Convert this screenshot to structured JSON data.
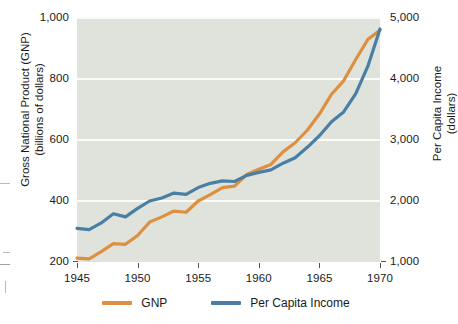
{
  "chart_data": {
    "type": "line",
    "title": "",
    "xlabel": "",
    "ylabel": "Gross National Product (GNP)\n(billions of dollars)",
    "y2label": "Per Capita Income\n(dollars)",
    "grid": true,
    "legend_position": "bottom",
    "xlim": [
      1945,
      1970
    ],
    "ylim": [
      200,
      1000
    ],
    "y2lim": [
      1000,
      5000
    ],
    "xticks": [
      "1945",
      "1950",
      "1955",
      "1960",
      "1965",
      "1970"
    ],
    "xtick_values": [
      1945,
      1950,
      1955,
      1960,
      1965,
      1970
    ],
    "yticks": [
      "200",
      "400",
      "600",
      "800",
      "1,000"
    ],
    "ytick_values": [
      200,
      400,
      600,
      800,
      1000
    ],
    "y2ticks": [
      "1,000",
      "2,000",
      "3,000",
      "4,000",
      "5,000"
    ],
    "y2tick_values": [
      1000,
      2000,
      3000,
      4000,
      5000
    ],
    "x": [
      1945,
      1946,
      1947,
      1948,
      1949,
      1950,
      1951,
      1952,
      1953,
      1954,
      1955,
      1956,
      1957,
      1958,
      1959,
      1960,
      1961,
      1962,
      1963,
      1964,
      1965,
      1966,
      1967,
      1968,
      1969,
      1970
    ],
    "series": [
      {
        "name": "GNP",
        "color": "#dd9040",
        "axis": "left",
        "units": "billions of dollars",
        "values": [
          213,
          210,
          234,
          260,
          258,
          287,
          331,
          348,
          367,
          363,
          400,
          421,
          444,
          449,
          487,
          504,
          520,
          561,
          591,
          632,
          685,
          750,
          794,
          864,
          930,
          960
        ]
      },
      {
        "name": "Per Capita Income",
        "color": "#4a7fa5",
        "axis": "right",
        "units": "dollars",
        "values": [
          1550,
          1530,
          1640,
          1790,
          1740,
          1880,
          2000,
          2050,
          2130,
          2110,
          2220,
          2290,
          2330,
          2320,
          2420,
          2470,
          2510,
          2620,
          2710,
          2880,
          3070,
          3300,
          3460,
          3760,
          4210,
          4820
        ]
      }
    ]
  },
  "legend": {
    "items": [
      {
        "label": "GNP",
        "color": "#dd9040"
      },
      {
        "label": "Per Capita Income",
        "color": "#4a7fa5"
      }
    ]
  },
  "colors": {
    "gnp": "#dd9040",
    "per_capita_income": "#4a7fa5",
    "plot_background": "#dfe3dc",
    "gridline": "#fbfbf8",
    "page_background": "#ffffff"
  },
  "edge_marks": {
    "glyph_1": "—"
  }
}
